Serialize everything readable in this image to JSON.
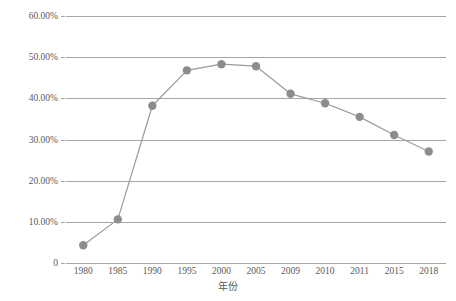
{
  "chart_data": {
    "type": "line",
    "title": "",
    "subtitle": "",
    "xlabel": "年份",
    "ylabel": "",
    "categories": [
      "1980",
      "1985",
      "1990",
      "1995",
      "2000",
      "2005",
      "2009",
      "2010",
      "2011",
      "2015",
      "2018"
    ],
    "values": [
      4.3,
      10.6,
      38.2,
      46.8,
      48.3,
      47.8,
      41.1,
      38.8,
      35.5,
      31.1,
      27.1
    ],
    "series": [
      {
        "name": "",
        "values": [
          4.3,
          10.6,
          38.2,
          46.8,
          48.3,
          47.8,
          41.1,
          38.8,
          35.5,
          31.1,
          27.1
        ]
      }
    ],
    "ylim": [
      0,
      60
    ],
    "ytick_labels": [
      "0",
      "10.00%",
      "20.00%",
      "30.00%",
      "40.00%",
      "50.00%",
      "60.00%"
    ],
    "ytick_values": [
      0,
      10,
      20,
      30,
      40,
      50,
      60
    ],
    "grid": "horizontal",
    "legend": "none",
    "marker": "circle",
    "colors": {
      "line": "#9a9a9a",
      "marker": "#8c8c8c",
      "gridline": "#a6a6a6",
      "text": "#595959",
      "background": "#ffffff"
    }
  },
  "axis": {
    "x_title": "年份",
    "y_ticks": [
      {
        "label": "60.00%",
        "value": 60
      },
      {
        "label": "50.00%",
        "value": 50
      },
      {
        "label": "40.00%",
        "value": 40
      },
      {
        "label": "30.00%",
        "value": 30
      },
      {
        "label": "20.00%",
        "value": 20
      },
      {
        "label": "10.00%",
        "value": 10
      },
      {
        "label": "0",
        "value": 0
      }
    ],
    "x_ticks": [
      "1980",
      "1985",
      "1990",
      "1995",
      "2000",
      "2005",
      "2009",
      "2010",
      "2011",
      "2015",
      "2018"
    ]
  }
}
